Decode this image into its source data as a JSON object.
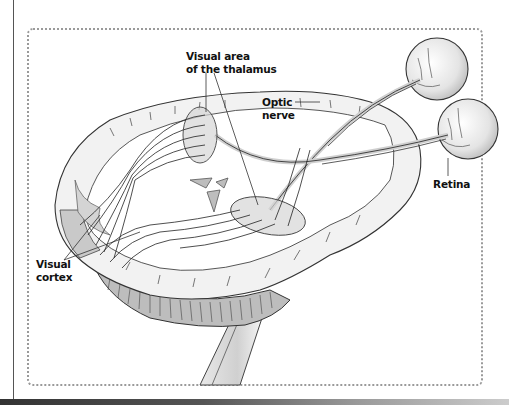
{
  "diagram": {
    "labels": {
      "thalamus_line1": "Visual area",
      "thalamus_line2": "of the thalamus",
      "optic_line1": "Optic",
      "optic_line2": "nerve",
      "retina": "Retina",
      "cortex_line1": "Visual",
      "cortex_line2": "cortex"
    },
    "colors": {
      "border": "#9a9a9a",
      "outline": "#333333",
      "brain_fill": "#ededed",
      "shade": "#c8c8c8",
      "thalamus_fill": "#d6d6d6"
    }
  }
}
